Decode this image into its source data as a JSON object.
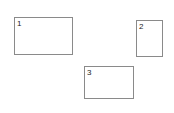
{
  "boxes": [
    {
      "label": "1"
    },
    {
      "label": "2"
    },
    {
      "label": "3"
    }
  ],
  "colors": {
    "border": "#8a8a8a",
    "text": "#222222",
    "background": "#ffffff"
  }
}
